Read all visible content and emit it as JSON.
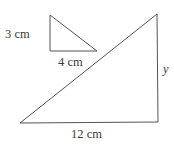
{
  "diagram": {
    "small_triangle": {
      "vertices": [
        [
          50,
          15
        ],
        [
          50,
          51
        ],
        [
          97,
          51
        ]
      ],
      "labels": {
        "vertical_side": "3 cm",
        "horizontal_side": "4 cm"
      }
    },
    "large_triangle": {
      "vertices": [
        [
          20,
          123
        ],
        [
          158,
          122
        ],
        [
          157,
          14
        ]
      ],
      "labels": {
        "vertical_side": "y",
        "horizontal_side": "12 cm"
      }
    },
    "stroke_color": "#555555",
    "text_color": "#3a3a3a"
  }
}
